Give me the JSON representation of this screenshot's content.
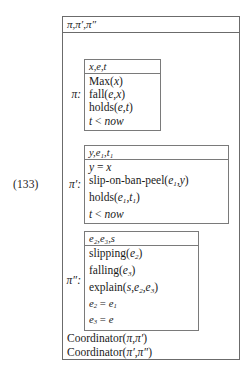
{
  "equation": {
    "number": "(133)"
  },
  "outer": {
    "header": "π,π′,π″"
  },
  "boxes": [
    {
      "label": "π:",
      "name": "drs-box-pi",
      "header": "x,e,t",
      "conditions": [
        "Max(x)",
        "fall(e,x)",
        "holds(e,t)",
        "t < now"
      ]
    },
    {
      "label": "π′:",
      "name": "drs-box-pi-prime",
      "header": "y,e₁,t₁",
      "conditions": [
        "y = x",
        "slip-on-ban-peel(e₁,y)",
        "holds(e₁,t₁)",
        "t < now"
      ]
    },
    {
      "label": "π″:",
      "name": "drs-box-pi-double-prime",
      "header": "e₂,e₃,s",
      "conditions": [
        "slipping(e₂)",
        "falling(e₃)",
        "explain(s,e₂,e₃)",
        "e₂ = e₁",
        "e₃ = e"
      ]
    }
  ],
  "coordinators": [
    "Coordinator(π,π′)",
    "Coordinator(π′,π″)"
  ],
  "colors": {
    "text": "#1a1a1a",
    "border_outer": "#6b6b6b",
    "border_inner": "#7a7a7a",
    "background": "#ffffff"
  }
}
